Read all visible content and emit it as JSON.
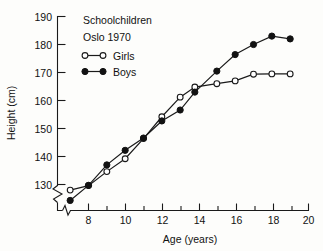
{
  "chart_data": {
    "type": "line",
    "title": "Schoolchildren",
    "subtitle": "Oslo 1970",
    "xlabel": "Age (years)",
    "ylabel": "Height (cm)",
    "xlim": [
      6.6,
      20
    ],
    "ylim": [
      123,
      190
    ],
    "grid": false,
    "legend_position": "top-left",
    "axis_breaks": {
      "y_break_below": 130,
      "x_break_below": 7.4
    },
    "x_ticks_major": [
      8,
      10,
      12,
      14,
      16,
      18,
      20
    ],
    "x_ticks_minor": [
      9,
      11,
      13,
      15,
      17,
      19
    ],
    "y_ticks": [
      130,
      140,
      150,
      160,
      170,
      180,
      190
    ],
    "series": [
      {
        "name": "Girls",
        "marker": "open-circle",
        "x": [
          7,
          8,
          9,
          10,
          11,
          12,
          13,
          13.8,
          15,
          16,
          17,
          18,
          19
        ],
        "values": [
          128,
          129.6,
          134.6,
          139.2,
          146.4,
          154.2,
          161.2,
          164.8,
          166,
          167,
          169.4,
          169.5,
          169.5
        ]
      },
      {
        "name": "Boys",
        "marker": "filled-circle",
        "x": [
          7,
          8,
          9,
          10,
          11,
          12,
          13,
          13.8,
          15,
          16,
          17,
          18,
          19
        ],
        "values": [
          124.3,
          129.7,
          137,
          142.2,
          146.6,
          152.7,
          156.6,
          163,
          170.5,
          176.4,
          180,
          183,
          182
        ]
      }
    ]
  },
  "legend": {
    "girls_label": "Girls",
    "boys_label": "Boys"
  }
}
